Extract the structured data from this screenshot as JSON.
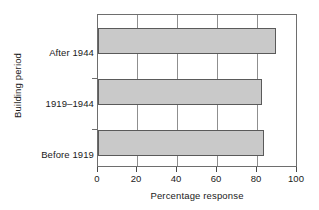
{
  "chart_data": {
    "type": "bar",
    "orientation": "horizontal",
    "title": "",
    "xlabel": "Percentage response",
    "ylabel": "Building period",
    "categories": [
      "Before 1919",
      "1919–1944",
      "After 1944"
    ],
    "values": [
      83,
      82,
      89
    ],
    "xlim": [
      0,
      100
    ],
    "xticks": [
      0,
      20,
      40,
      60,
      80,
      100
    ],
    "xtick_labels": [
      "0",
      "20",
      "40",
      "60",
      "80",
      "100"
    ],
    "grid": "vertical",
    "legend": null,
    "bar_color": "#c9c9c9",
    "bar_edge_color": "#5a5a5a",
    "frame_color": "#6e6e6e"
  }
}
